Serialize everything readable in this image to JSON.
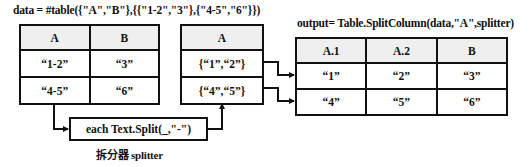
{
  "data_caption": "data = #table({\"A\",\"B\"},{{\"1-2\",\"3\"},{\"4-5\",\"6\"}})",
  "output_caption": "output= Table.SplitColumn(data,\"A\",splitter)",
  "input_table": {
    "headers": [
      "A",
      "B"
    ],
    "rows": [
      [
        "“1-2”",
        "“3”"
      ],
      [
        "“4-5”",
        "“6”"
      ]
    ]
  },
  "split_table": {
    "headers": [
      "A"
    ],
    "rows": [
      [
        "{“1”,“2”}"
      ],
      [
        "{“4”,“5”}"
      ]
    ]
  },
  "output_table": {
    "headers": [
      "A.1",
      "A.2",
      "B"
    ],
    "rows": [
      [
        "“1”",
        "“2”",
        "“3”"
      ],
      [
        "“4”",
        "“5”",
        "“6”"
      ]
    ]
  },
  "splitter": {
    "expression": "each Text.Split(_,\"-\")",
    "label": "拆分器 splitter"
  },
  "colors": {
    "line": "#111111",
    "header_fill": "#efefef"
  }
}
